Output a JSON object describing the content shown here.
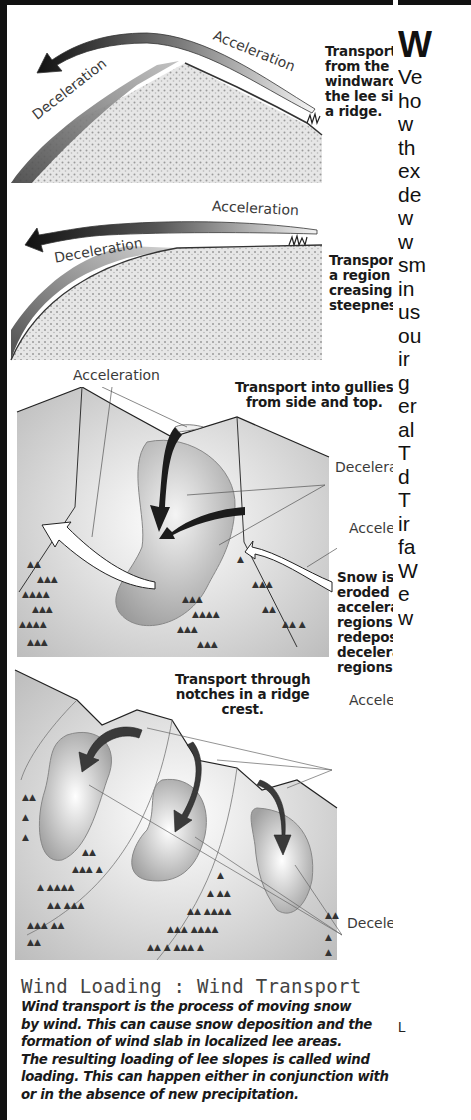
{
  "left_panel": {
    "diagram1": {
      "label_acceleration": "Acceleration",
      "label_deceleration": "Deceleration",
      "caption_lines": [
        "Transport",
        "from the",
        "windward to",
        "the lee side of",
        "a ridge."
      ]
    },
    "diagram2": {
      "label_acceleration": "Acceleration",
      "label_deceleration": "Deceleration",
      "caption_lines": [
        "Transport to",
        "a region of in-",
        "creasing slope",
        "steepness."
      ]
    },
    "diagram3": {
      "label_acceleration_top": "Acceleration",
      "title_lines": [
        "Transport into gullies",
        "from side and top."
      ],
      "label_deceleration": "Deceleration",
      "label_acceleration_right": "Acceleration",
      "caption_lines": [
        "Snow is",
        "eroded from",
        "acceleration",
        "regions and",
        "redeposited in",
        "deceleration",
        "regions."
      ]
    },
    "diagram4": {
      "title_lines": [
        "Transport through",
        "notches in a ridge",
        "crest."
      ],
      "label_acceleration": "Acceleration",
      "label_deceleration": "Deceleration"
    },
    "section": {
      "title": "Wind Loading : Wind Transport",
      "body_lines": [
        "Wind transport is the process of moving snow",
        "by wind. This can cause snow deposition and the",
        "formation of wind slab in localized lee areas.",
        "The resulting loading of lee slopes is called wind",
        "loading. This can happen either in conjunction with",
        "or in the absence of new precipitation."
      ]
    }
  },
  "right_column": {
    "heading": "W",
    "line_fragments": [
      "Ve",
      "ho",
      "w",
      "th",
      "ex",
      "de",
      "w",
      "w",
      "sm",
      "in",
      "us",
      "ou",
      "ir",
      "g",
      "er",
      "al",
      "T",
      "d",
      "T",
      "ir",
      "fa",
      "W",
      "e",
      "w"
    ],
    "footer_fragment": "L"
  },
  "colors": {
    "border": "#111111",
    "text": "#1a1a1a",
    "label_gray": "#3a3a3a",
    "snow_texture": "#c8c8c8",
    "arrow_dark": "#1e1e1e"
  }
}
